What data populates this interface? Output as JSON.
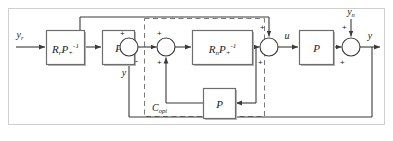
{
  "diagram": {
    "type": "control-block-diagram",
    "colors": {
      "line": "#3a3a3a",
      "block_border": "#6e6e6e",
      "block_fill": "#ffffff",
      "dashed": "#7a7a7a",
      "outer_border": "#cfcfcf",
      "text": "#1a1a1a",
      "shadow": "#b9b9b9"
    },
    "signals": {
      "reference": "y",
      "reference_sub": "r",
      "measured": "y",
      "control": "u",
      "noise": "y",
      "noise_sub": "n",
      "output": "y"
    },
    "blocks": [
      {
        "id": "rr-pinv",
        "label_main": "R",
        "label_sub": "r",
        "label_main2": "P",
        "label_sub2": "+",
        "label_sup2": "-1",
        "x": 46,
        "y": 30,
        "w": 38,
        "h": 34
      },
      {
        "id": "p-forward",
        "label_main": "P",
        "label_sub": "",
        "label_main2": "",
        "label_sub2": "",
        "label_sup2": "",
        "x": 102,
        "y": 30,
        "w": 32,
        "h": 34
      },
      {
        "id": "rn-pinv",
        "label_main": "R",
        "label_sub": "n",
        "label_main2": "P",
        "label_sub2": "+",
        "label_sup2": "-1",
        "x": 192,
        "y": 30,
        "w": 60,
        "h": 34
      },
      {
        "id": "p-plant",
        "label_main": "P",
        "label_sub": "",
        "label_main2": "",
        "label_sub2": "",
        "label_sup2": "",
        "x": 299,
        "y": 30,
        "w": 34,
        "h": 34
      },
      {
        "id": "p-feedback",
        "label_main": "P",
        "label_sub": "",
        "label_main2": "",
        "label_sub2": "",
        "label_sup2": "",
        "x": 203,
        "y": 88,
        "w": 32,
        "h": 30
      }
    ],
    "summers": [
      {
        "id": "sum-1",
        "cx": 129,
        "cy": 47,
        "r": 9,
        "signs": [
          {
            "s": "+",
            "x": 117,
            "y": 35
          },
          {
            "s": "-",
            "x": 138,
            "y": 62
          }
        ]
      },
      {
        "id": "sum-2",
        "cx": 166,
        "cy": 47,
        "r": 9,
        "signs": [
          {
            "s": "+",
            "x": 155,
            "y": 35
          },
          {
            "s": "+",
            "x": 155,
            "y": 62
          }
        ]
      },
      {
        "id": "sum-3",
        "cx": 269,
        "cy": 47,
        "r": 9,
        "signs": [
          {
            "s": "+",
            "x": 258,
            "y": 28
          },
          {
            "s": "+",
            "x": 258,
            "y": 62
          }
        ]
      },
      {
        "id": "sum-4",
        "cx": 351,
        "cy": 47,
        "r": 9,
        "signs": [
          {
            "s": "+",
            "x": 340,
            "y": 28
          },
          {
            "s": "+",
            "x": 340,
            "y": 62
          }
        ]
      }
    ],
    "controller_box": {
      "label_main": "C",
      "label_sub": "opt",
      "x": 144,
      "y": 18,
      "w": 120,
      "h": 98
    },
    "labels": {
      "yr": "y",
      "yr_sub": "r",
      "y_mid": "y",
      "u": "u",
      "yn": "y",
      "yn_sub": "n",
      "y_out": "y",
      "copt": "C",
      "copt_sub": "opt",
      "exp_inv": "-1",
      "sub_plus": "+",
      "sub_r": "r",
      "sub_n": "n",
      "P": "P",
      "R": "R"
    }
  }
}
